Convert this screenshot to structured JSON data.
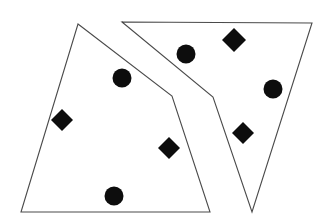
{
  "figure": {
    "background_color": "#ffffff",
    "width": 330,
    "height": 222
  },
  "chart_data": {
    "type": "scatter",
    "subtitle": "",
    "xlabel": "",
    "ylabel": "",
    "xlim": [
      0,
      330
    ],
    "ylim": [
      0,
      222
    ],
    "grid": false,
    "legend_position": "none",
    "axes_visible": false,
    "tick_labels_x": [],
    "tick_labels_y": [],
    "annotations": [],
    "marker_colors": {
      "fill": "#0d0d0d",
      "outline_stroke": "#4a4a4a"
    },
    "regions": [
      {
        "name": "left-region",
        "shape": "quadrilateral",
        "vertex_count": 4,
        "points": "78,24 172,96 210,212 21,212",
        "fill": "#ffffff",
        "stroke": "#4a4a4a",
        "stroke_width": 1.1
      },
      {
        "name": "right-region",
        "shape": "quadrilateral",
        "vertex_count": 4,
        "points": "122,22 312,23 252,212 213,97",
        "fill": "#ffffff",
        "stroke": "#4a4a4a",
        "stroke_width": 1.1
      }
    ],
    "series": [
      {
        "name": "circles",
        "marker": "circle",
        "count": 4,
        "points": [
          {
            "label": "circle-left-upper",
            "x": 122,
            "y": 78,
            "r": 9.5,
            "region": "left-region"
          },
          {
            "label": "circle-left-lower",
            "x": 114,
            "y": 196,
            "r": 9.5,
            "region": "left-region"
          },
          {
            "label": "circle-right-upper",
            "x": 186,
            "y": 54,
            "r": 9.5,
            "region": "right-region"
          },
          {
            "label": "circle-right-middle",
            "x": 273,
            "y": 89,
            "r": 9.5,
            "region": "right-region"
          }
        ]
      },
      {
        "name": "diamonds",
        "marker": "diamond",
        "count": 4,
        "points": [
          {
            "label": "diamond-left-outer",
            "x": 62,
            "y": 120,
            "r": 11,
            "region": "left-region"
          },
          {
            "label": "diamond-left-inner",
            "x": 169,
            "y": 148,
            "r": 11,
            "region": "left-region"
          },
          {
            "label": "diamond-right-top",
            "x": 234,
            "y": 40,
            "r": 12,
            "region": "right-region"
          },
          {
            "label": "diamond-right-lower",
            "x": 243,
            "y": 133,
            "r": 11,
            "region": "right-region"
          }
        ]
      }
    ]
  }
}
